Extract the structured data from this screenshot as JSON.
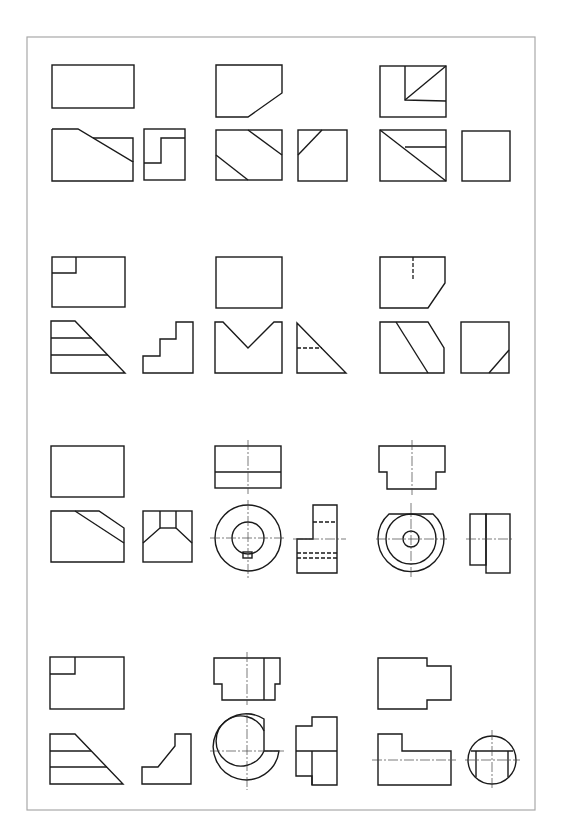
{
  "page": {
    "layout": {
      "rows": 4,
      "columns": 3
    },
    "colors": {
      "paper": "#ffffff",
      "line": "#1a1a1a",
      "frame": "#a8a8a8"
    }
  },
  "problems": [
    {
      "id": 1,
      "row": 1,
      "col": 1,
      "views": [
        "top",
        "front",
        "side"
      ],
      "description": "Rectangular block with sloped step; side view shows step profile"
    },
    {
      "id": 2,
      "row": 1,
      "col": 2,
      "views": [
        "top",
        "front",
        "side"
      ],
      "description": "Block with chamfered corner; front shows two diagonal edges"
    },
    {
      "id": 3,
      "row": 1,
      "col": 3,
      "views": [
        "top",
        "front",
        "side"
      ],
      "description": "Block with corner notch; top shows inner rectangle with diagonal"
    },
    {
      "id": 4,
      "row": 2,
      "col": 1,
      "views": [
        "top",
        "front",
        "side"
      ],
      "description": "Stepped wedge; side view is staircase"
    },
    {
      "id": 5,
      "row": 2,
      "col": 2,
      "views": [
        "top",
        "front",
        "side"
      ],
      "description": "Block with V-groove; side view triangle with hidden line"
    },
    {
      "id": 6,
      "row": 2,
      "col": 3,
      "views": [
        "top",
        "front",
        "side"
      ],
      "description": "Block with chamfered edge and slot; hidden line in top view"
    },
    {
      "id": 7,
      "row": 3,
      "col": 1,
      "views": [
        "top",
        "front",
        "side"
      ],
      "description": "Block with sloped cut; side view trapezoidal recess"
    },
    {
      "id": 8,
      "row": 3,
      "col": 2,
      "views": [
        "top",
        "front",
        "side"
      ],
      "description": "Cylindrical bushing with keyway; hidden bore lines in side view"
    },
    {
      "id": 9,
      "row": 3,
      "col": 3,
      "views": [
        "top",
        "front",
        "side"
      ],
      "description": "Flanged cylinder with flat; concentric circles with center hole"
    },
    {
      "id": 10,
      "row": 4,
      "col": 1,
      "views": [
        "top",
        "front",
        "side"
      ],
      "description": "Stepped wedge with corner notch; side view angled bracket"
    },
    {
      "id": 11,
      "row": 4,
      "col": 2,
      "views": [
        "top",
        "front",
        "side"
      ],
      "description": "Split ring / C-shaped sleeve with stepped profile"
    },
    {
      "id": 12,
      "row": 4,
      "col": 3,
      "views": [
        "top",
        "front",
        "side"
      ],
      "description": "Stepped shaft with flat; end view circle with flat cut"
    }
  ]
}
